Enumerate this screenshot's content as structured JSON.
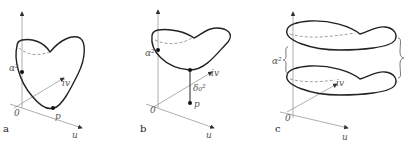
{
  "panels": [
    {
      "id": "a",
      "label": "a",
      "axis_labels": {
        "origin": "0",
        "u": "u",
        "iv": "iv"
      },
      "point_labels": {
        "alpha": "α²",
        "p": "p"
      }
    },
    {
      "id": "b",
      "label": "b",
      "axis_labels": {
        "origin": "0",
        "u": "u",
        "iv": "iv"
      },
      "point_labels": {
        "alpha": "α²",
        "p": "p",
        "delta": "δ₀²"
      }
    },
    {
      "id": "c",
      "label": "c",
      "axis_labels": {
        "origin": "0",
        "u": "u",
        "iv": "iv"
      },
      "point_labels": {
        "alpha": "α²"
      }
    }
  ]
}
